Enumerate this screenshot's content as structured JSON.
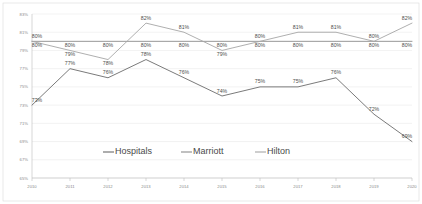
{
  "chart_data": {
    "type": "line",
    "title": "",
    "subtitle": "",
    "xlabel": "",
    "ylabel": "",
    "categories": [
      "2010",
      "2011",
      "2012",
      "2013",
      "2014",
      "2015",
      "2016",
      "2017",
      "2018",
      "2019",
      "2020"
    ],
    "ylim": [
      65,
      83
    ],
    "yticks": [
      65,
      67,
      69,
      71,
      73,
      75,
      77,
      79,
      81,
      83
    ],
    "ytick_labels": [
      "65%",
      "67%",
      "69%",
      "71%",
      "73%",
      "75%",
      "77%",
      "79%",
      "81%",
      "83%"
    ],
    "grid": true,
    "legend_position": "bottom",
    "value_suffix": "%",
    "series": [
      {
        "name": "Hospitals",
        "color": "#6b6b6b",
        "values": [
          73,
          77,
          76,
          78,
          76,
          74,
          75,
          75,
          76,
          72,
          69
        ],
        "labels": [
          "73%",
          "77%",
          "76%",
          "78%",
          "76%",
          "74%",
          "75%",
          "75%",
          "76%",
          "72%",
          "69%"
        ]
      },
      {
        "name": "Marriott",
        "color": "#8c8c8c",
        "values": [
          80,
          80,
          80,
          80,
          80,
          80,
          80,
          80,
          80,
          80,
          80
        ],
        "labels": [
          "80%",
          "80%",
          "80%",
          "80%",
          "80%",
          "80%",
          "80%",
          "80%",
          "80%",
          "80%",
          "80%"
        ]
      },
      {
        "name": "Hilton",
        "color": "#a6a6a6",
        "values": [
          80,
          79,
          78,
          82,
          81,
          79,
          80,
          81,
          81,
          80,
          82
        ],
        "labels": [
          "80%",
          "79%",
          "78%",
          "82%",
          "81%",
          "79%",
          "80%",
          "81%",
          "81%",
          "80%",
          "82%"
        ]
      }
    ],
    "legend": [
      {
        "label": "Hospitals",
        "color": "#6b6b6b"
      },
      {
        "label": "Marriott",
        "color": "#8c8c8c"
      },
      {
        "label": "Hilton",
        "color": "#a6a6a6"
      }
    ]
  }
}
